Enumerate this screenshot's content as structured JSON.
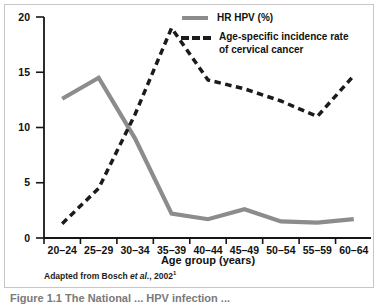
{
  "figure": {
    "legend": {
      "series1_label": "HR HPV (%)",
      "series2_label_line1": "Age-specific incidence rate",
      "series2_label_line2": "of cervical cancer"
    },
    "source_note": {
      "prefix": "Adapted from Bosch ",
      "etal": "et al.",
      "suffix": ", 2002",
      "superscript": "1"
    },
    "caption_fragment": "Figure 1.1  The National ... HPV infection ..."
  },
  "chart_data": {
    "type": "line",
    "title": "",
    "xlabel": "Age group (years)",
    "ylabel": "",
    "ylim": [
      0,
      20
    ],
    "y_ticks": [
      0,
      5,
      10,
      15,
      20
    ],
    "grid": false,
    "legend_position": "top-right",
    "categories": [
      "20–24",
      "25–29",
      "30–34",
      "35–39",
      "40–44",
      "45–49",
      "50–54",
      "55–59",
      "60–64"
    ],
    "series": [
      {
        "name": "HR HPV (%)",
        "style": "solid",
        "color": "#8c8c8c",
        "values": [
          12.6,
          14.5,
          9.0,
          2.2,
          1.7,
          2.6,
          1.5,
          1.4,
          1.7
        ]
      },
      {
        "name": "Age-specific incidence rate of cervical cancer",
        "style": "dashed",
        "color": "#1b1b1b",
        "values": [
          1.3,
          4.5,
          11.2,
          19.0,
          14.3,
          13.5,
          12.4,
          11.0,
          14.7
        ]
      }
    ]
  },
  "colors": {
    "border": "#c6c6c6",
    "axis": "#161616",
    "background": "#ffffff"
  }
}
